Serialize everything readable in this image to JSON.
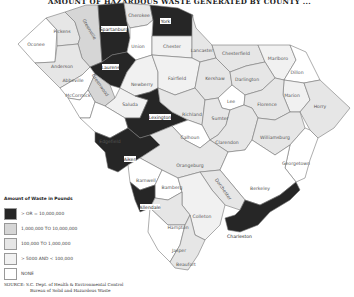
{
  "title": "AMOUNT OF HAZARDOUS WASTE GENERATED BY COUNTY ...",
  "colors": {
    "cat1": "#262626",
    "cat2": "#d6d6d6",
    "cat3": "#e6e6e6",
    "cat4": "#f1f1f1",
    "cat5": "#ffffff"
  },
  "legend": {
    "title": "Amount of Waste in Pounds",
    "items": [
      {
        "label": "> OR = 10,000,000",
        "category": "cat1"
      },
      {
        "label": "1,000,000 TO 10,000,000",
        "category": "cat2"
      },
      {
        "label": "100,000 TO 1,000,000",
        "category": "cat3"
      },
      {
        "label": "> 5000 AND < 100,000",
        "category": "cat4"
      },
      {
        "label": "NONE",
        "category": "cat5"
      }
    ]
  },
  "source": {
    "line1": "SOURCE:  S.C. Dept. of Health & Environmental Control",
    "line2": "Bureau of Solid and Hazardous Waste"
  },
  "counties": [
    {
      "name": "Oconee",
      "category": "cat5"
    },
    {
      "name": "Pickens",
      "category": "cat3"
    },
    {
      "name": "Greenville",
      "category": "cat2"
    },
    {
      "name": "Spartanburg",
      "category": "cat1"
    },
    {
      "name": "Cherokee",
      "category": "cat3"
    },
    {
      "name": "York",
      "category": "cat1"
    },
    {
      "name": "Anderson",
      "category": "cat3"
    },
    {
      "name": "Laurens",
      "category": "cat1"
    },
    {
      "name": "Union",
      "category": "cat5"
    },
    {
      "name": "Chester",
      "category": "cat4"
    },
    {
      "name": "Lancaster",
      "category": "cat3"
    },
    {
      "name": "Chesterfield",
      "category": "cat3"
    },
    {
      "name": "Marlboro",
      "category": "cat4"
    },
    {
      "name": "Dillon",
      "category": "cat5"
    },
    {
      "name": "Abbeville",
      "category": "cat5"
    },
    {
      "name": "Greenwood",
      "category": "cat2"
    },
    {
      "name": "McCormick",
      "category": "cat5"
    },
    {
      "name": "Newberry",
      "category": "cat4"
    },
    {
      "name": "Fairfield",
      "category": "cat4"
    },
    {
      "name": "Kershaw",
      "category": "cat3"
    },
    {
      "name": "Darlington",
      "category": "cat3"
    },
    {
      "name": "Lee",
      "category": "cat5"
    },
    {
      "name": "Marion",
      "category": "cat4"
    },
    {
      "name": "Florence",
      "category": "cat3"
    },
    {
      "name": "Horry",
      "category": "cat3"
    },
    {
      "name": "Saluda",
      "category": "cat4"
    },
    {
      "name": "Edgefield",
      "category": "cat5"
    },
    {
      "name": "Lexington",
      "category": "cat1"
    },
    {
      "name": "Richland",
      "category": "cat3"
    },
    {
      "name": "Sumter",
      "category": "cat3"
    },
    {
      "name": "Calhoun",
      "category": "cat5"
    },
    {
      "name": "Clarendon",
      "category": "cat3"
    },
    {
      "name": "Williamsburg",
      "category": "cat3"
    },
    {
      "name": "Aiken",
      "category": "cat1"
    },
    {
      "name": "Orangeburg",
      "category": "cat3"
    },
    {
      "name": "Georgetown",
      "category": "cat5"
    },
    {
      "name": "Barnwell",
      "category": "cat5"
    },
    {
      "name": "Bamberg",
      "category": "cat5"
    },
    {
      "name": "Berkeley",
      "category": "cat5"
    },
    {
      "name": "Dorchester",
      "category": "cat3"
    },
    {
      "name": "Allendale",
      "category": "cat1"
    },
    {
      "name": "Colleton",
      "category": "cat4"
    },
    {
      "name": "Hampton",
      "category": "cat3"
    },
    {
      "name": "Charleston",
      "category": "cat1"
    },
    {
      "name": "Jasper",
      "category": "cat5"
    },
    {
      "name": "Beaufort",
      "category": "cat3"
    }
  ]
}
